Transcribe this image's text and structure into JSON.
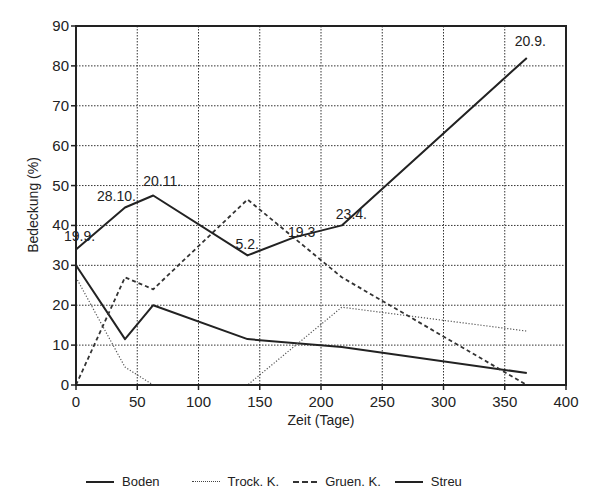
{
  "chart_data": {
    "type": "line",
    "title": "",
    "xlabel": "Zeit (Tage)",
    "ylabel": "Bedeckung (%)",
    "xlim": [
      0,
      400
    ],
    "ylim": [
      0,
      90
    ],
    "xticks": [
      0,
      50,
      100,
      150,
      200,
      250,
      300,
      350,
      400
    ],
    "yticks": [
      0,
      10,
      20,
      30,
      40,
      50,
      60,
      70,
      80,
      90
    ],
    "grid": true,
    "legend_position": "bottom",
    "series": [
      {
        "name": "Boden",
        "style": "solid",
        "x": [
          0,
          40,
          63,
          140,
          217,
          368
        ],
        "y": [
          30,
          11.5,
          20,
          11.5,
          9.5,
          3
        ]
      },
      {
        "name": "Trock. K.",
        "style": "dotted",
        "x": [
          0,
          40,
          63,
          140,
          217,
          368
        ],
        "y": [
          27,
          4.5,
          0,
          0,
          19.5,
          13.5
        ]
      },
      {
        "name": "Gruen. K.",
        "style": "dashed",
        "x": [
          0,
          40,
          63,
          140,
          217,
          368
        ],
        "y": [
          0,
          27,
          24,
          46.5,
          27,
          0
        ]
      },
      {
        "name": "Streu",
        "style": "solid",
        "x": [
          0,
          40,
          63,
          140,
          178,
          217,
          368
        ],
        "y": [
          34,
          44.5,
          47.5,
          32.5,
          37,
          40,
          82
        ]
      }
    ],
    "annotations": [
      {
        "text": "19.9.",
        "x": 0,
        "y": 34
      },
      {
        "text": "28.10.",
        "x": 40,
        "y": 44.5
      },
      {
        "text": "20.11.",
        "x": 63,
        "y": 47.5
      },
      {
        "text": "5.2.",
        "x": 140,
        "y": 32.5
      },
      {
        "text": "19.3",
        "x": 178,
        "y": 37
      },
      {
        "text": "23.4.",
        "x": 217,
        "y": 40
      },
      {
        "text": "20.9.",
        "x": 368,
        "y": 82
      }
    ]
  },
  "legend": {
    "items": [
      {
        "label": "Boden",
        "style": "solid"
      },
      {
        "label": "Trock. K.",
        "style": "dotted"
      },
      {
        "label": "Gruen. K.",
        "style": "dashed"
      },
      {
        "label": "Streu",
        "style": "solid"
      }
    ]
  },
  "axes": {
    "x_title": "Zeit (Tage)",
    "y_title": "Bedeckung (%)"
  }
}
